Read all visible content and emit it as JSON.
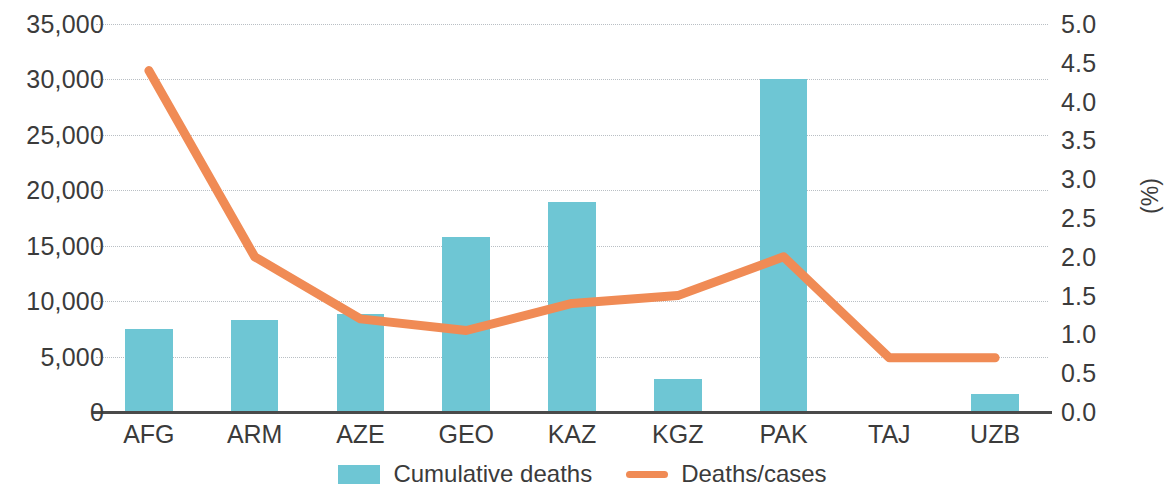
{
  "chart_data": {
    "type": "bar",
    "title": "",
    "subtitle": "",
    "xlabel": "",
    "ylabel": "",
    "y2label": "(%)",
    "categories": [
      "AFG",
      "ARM",
      "AZE",
      "GEO",
      "KAZ",
      "KGZ",
      "PAK",
      "TAJ",
      "UZB"
    ],
    "series": [
      {
        "name": "Cumulative deaths",
        "type": "bar",
        "axis": "left",
        "color": "#6EC6D4",
        "values": [
          7500,
          8300,
          8850,
          15800,
          18900,
          3000,
          30000,
          0,
          1600
        ]
      },
      {
        "name": "Deaths/cases",
        "type": "line",
        "axis": "right",
        "color": "#F08B55",
        "values": [
          4.4,
          2.0,
          1.2,
          1.05,
          1.4,
          1.5,
          2.0,
          0.7,
          0.7
        ]
      }
    ],
    "ylim": [
      0,
      35000
    ],
    "yticks": [
      0,
      5000,
      10000,
      15000,
      20000,
      25000,
      30000,
      35000
    ],
    "ytick_labels": [
      "0",
      "5,000",
      "10,000",
      "15,000",
      "20,000",
      "25,000",
      "30,000",
      "35,000"
    ],
    "y2lim": [
      0,
      5.0
    ],
    "y2ticks": [
      0,
      0.5,
      1.0,
      1.5,
      2.0,
      2.5,
      3.0,
      3.5,
      4.0,
      4.5,
      5.0
    ],
    "y2tick_labels": [
      "0.0",
      "0.5",
      "1.0",
      "1.5",
      "2.0",
      "2.5",
      "3.0",
      "3.5",
      "4.0",
      "4.5",
      "5.0"
    ],
    "grid": true,
    "grid_style": "dotted",
    "legend_position": "bottom",
    "legend": [
      "Cumulative deaths",
      "Deaths/cases"
    ]
  },
  "legend": {
    "bar_label": "Cumulative deaths",
    "line_label": "Deaths/cases"
  },
  "colors": {
    "bar": "#6EC6D4",
    "line": "#F08B55",
    "grid": "#b9bfc4",
    "axis": "#4a4a4a",
    "text": "#3b3b3b"
  }
}
